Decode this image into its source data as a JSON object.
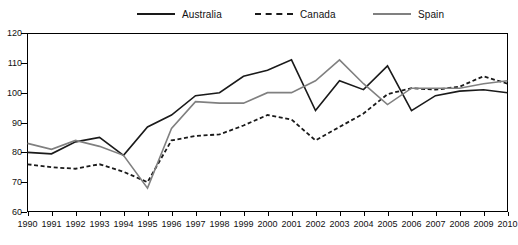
{
  "legend": {
    "position": "top",
    "entries": [
      {
        "name": "Australia",
        "style": "solid",
        "color": "#1a1a1a",
        "icon": "line-swatch-icon"
      },
      {
        "name": "Canada",
        "style": "dashed",
        "color": "#1a1a1a",
        "icon": "dashed-line-swatch-icon"
      },
      {
        "name": "Spain",
        "style": "solid",
        "color": "#808080",
        "icon": "line-swatch-icon"
      }
    ]
  },
  "axes": {
    "y_ticks": [
      "120",
      "110",
      "100",
      "90",
      "80",
      "70",
      "60"
    ],
    "x_ticks": [
      "1990",
      "1991",
      "1992",
      "1993",
      "1994",
      "1995",
      "1996",
      "1997",
      "1998",
      "1999",
      "2000",
      "2001",
      "2002",
      "2003",
      "2004",
      "2005",
      "2006",
      "2007",
      "2008",
      "2009",
      "2010"
    ]
  },
  "chart_data": {
    "type": "line",
    "title": "",
    "xlabel": "",
    "ylabel": "",
    "xlim": [
      1990,
      2010
    ],
    "ylim": [
      60,
      120
    ],
    "ytick_step": 10,
    "grid": false,
    "legend_position": "top",
    "x": [
      1990,
      1991,
      1992,
      1993,
      1994,
      1995,
      1996,
      1997,
      1998,
      1999,
      2000,
      2001,
      2002,
      2003,
      2004,
      2005,
      2006,
      2007,
      2008,
      2009,
      2010
    ],
    "series": [
      {
        "name": "Australia",
        "style": "solid",
        "color": "#1a1a1a",
        "values": [
          80,
          79.5,
          83.5,
          85,
          79,
          88.5,
          92.5,
          99,
          100,
          105.5,
          107.5,
          111,
          94,
          104,
          101,
          109,
          94,
          99,
          100.5,
          101,
          100
        ]
      },
      {
        "name": "Canada",
        "style": "dashed",
        "color": "#1a1a1a",
        "values": [
          76,
          75,
          74.5,
          76,
          73.5,
          70,
          84,
          85.5,
          86,
          89,
          92.5,
          91,
          84,
          88.5,
          93,
          99.5,
          101.5,
          101,
          102,
          105.5,
          103
        ]
      },
      {
        "name": "Spain",
        "style": "solid",
        "color": "#808080",
        "values": [
          83,
          81,
          84,
          82,
          79,
          68,
          88,
          97,
          96.5,
          96.5,
          100,
          100,
          104,
          111,
          103,
          96,
          101.5,
          101.5,
          101.5,
          103,
          104
        ]
      }
    ]
  }
}
